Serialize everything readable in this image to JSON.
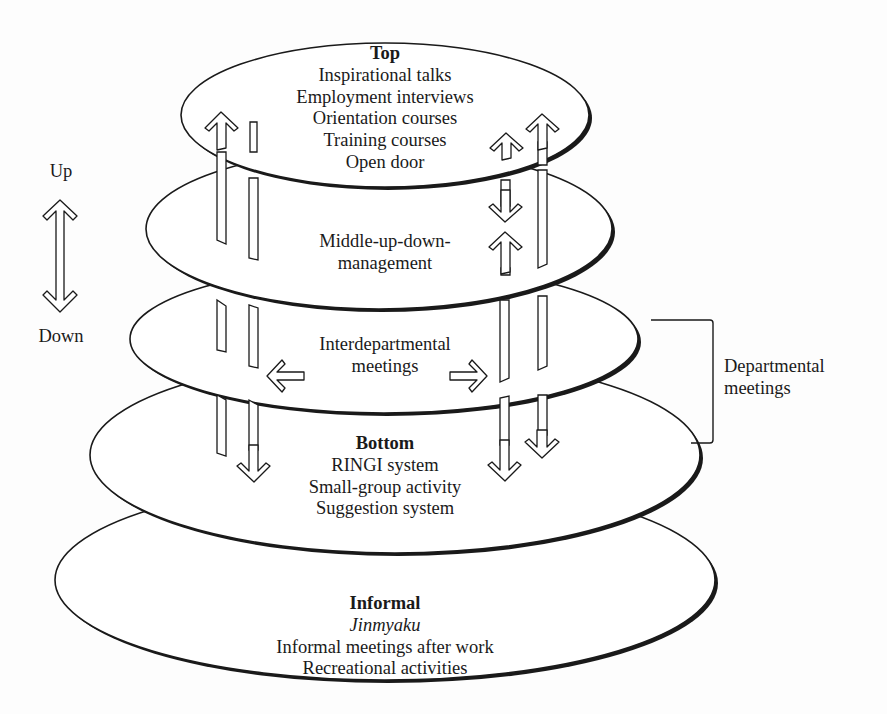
{
  "diagram": {
    "type": "stacked-ellipse communication levels",
    "colors": {
      "stroke": "#1a1a1a",
      "fill": "#ffffff",
      "background": "#fdfdfd"
    },
    "axis": {
      "up_label": "Up",
      "down_label": "Down",
      "icon": "double-headed-vertical-arrow"
    },
    "levels": [
      {
        "id": "top",
        "title": "Top",
        "items": [
          "Inspirational talks",
          "Employment interviews",
          "Orientation courses",
          "Training courses",
          "Open door"
        ]
      },
      {
        "id": "middle",
        "title": "",
        "items": [
          "Middle-up-down-",
          "management"
        ]
      },
      {
        "id": "interdepartmental",
        "title": "",
        "items": [
          "Interdepartmental",
          "meetings"
        ]
      },
      {
        "id": "bottom",
        "title": "Bottom",
        "items": [
          "RINGI system",
          "Small-group activity",
          "Suggestion system"
        ]
      },
      {
        "id": "informal",
        "title": "Informal",
        "italic_item": "Jinmyaku",
        "items": [
          "Informal meetings after work",
          "Recreational activities"
        ]
      }
    ],
    "bracket": {
      "label_line1": "Departmental",
      "label_line2": "meetings",
      "spans_levels": [
        "interdepartmental",
        "bottom"
      ]
    }
  }
}
